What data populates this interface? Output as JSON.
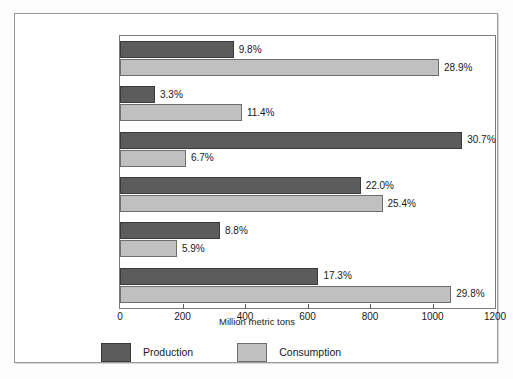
{
  "chart_data": {
    "type": "bar",
    "orientation": "horizontal",
    "title": "",
    "xlabel": "Million metric tons",
    "ylabel": "",
    "xlim": [
      0,
      1200
    ],
    "xticks": [
      0,
      200,
      400,
      600,
      800,
      1000,
      1200
    ],
    "xtick_labels": [
      "0",
      "200",
      "400",
      "600",
      "800",
      "1000",
      "1200"
    ],
    "grid": false,
    "legend_position": "bottom-left",
    "categories": [
      "Asia Pacific",
      "Africa",
      "Middle East",
      "Europe",
      "South and Central America",
      "North America"
    ],
    "category_lines": [
      [
        "Asia Pacific"
      ],
      [
        "Africa"
      ],
      [
        "Middle East"
      ],
      [
        "Europe"
      ],
      [
        "South and",
        "Central America"
      ],
      [
        "North America"
      ]
    ],
    "series": [
      {
        "name": "Production",
        "color": "#5c5c5c",
        "values": [
          364,
          112,
          1095,
          770,
          320,
          635
        ],
        "data_labels": [
          "9.8%",
          "3.3%",
          "30.7%",
          "22.0%",
          "8.8%",
          "17.3%"
        ]
      },
      {
        "name": "Consumption",
        "color": "#c0c0c0",
        "values": [
          1021,
          390,
          211,
          840,
          182,
          1060
        ],
        "data_labels": [
          "28.9%",
          "11.4%",
          "6.7%",
          "25.4%",
          "5.9%",
          "29.8%"
        ]
      }
    ]
  },
  "legend": {
    "items": [
      {
        "label": "Production",
        "swatch": "production"
      },
      {
        "label": "Consumption",
        "swatch": "consumption"
      }
    ]
  }
}
